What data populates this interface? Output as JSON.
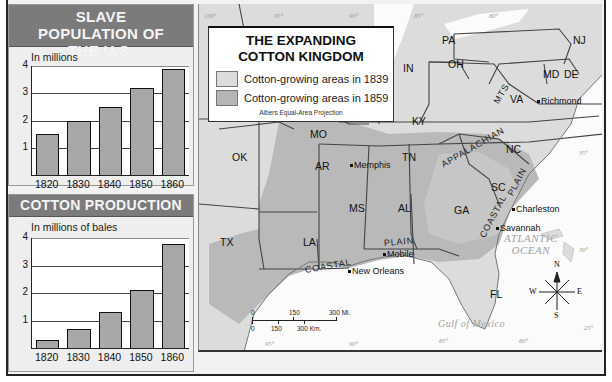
{
  "chart_data": [
    {
      "type": "bar",
      "title": "SLAVE POPULATION OF THE U.S.",
      "ylabel": "In millions",
      "xlabel": "",
      "categories": [
        "1820",
        "1830",
        "1840",
        "1850",
        "1860"
      ],
      "values": [
        1.5,
        2.0,
        2.5,
        3.2,
        3.9
      ],
      "ylim": [
        0,
        4
      ],
      "yticks": [
        "1",
        "2",
        "3",
        "4"
      ],
      "grid": true
    },
    {
      "type": "bar",
      "title": "COTTON PRODUCTION",
      "ylabel": "In millions of bales",
      "xlabel": "",
      "categories": [
        "1820",
        "1830",
        "1840",
        "1850",
        "1860"
      ],
      "values": [
        0.3,
        0.7,
        1.3,
        2.1,
        3.8
      ],
      "ylim": [
        0,
        4
      ],
      "yticks": [
        "1",
        "2",
        "3",
        "4"
      ],
      "grid": true
    }
  ],
  "map": {
    "title_line1": "THE EXPANDING",
    "title_line2": "COTTON KINGDOM",
    "legend": [
      {
        "label": "Cotton-growing areas in 1839",
        "color": "#d9d9d9"
      },
      {
        "label": "Cotton-growing areas in 1859",
        "color": "#b3b3b3"
      }
    ],
    "projection": "Albers Equal-Area Projection",
    "states": [
      {
        "abbr": "PA",
        "x": 442,
        "y": 34
      },
      {
        "abbr": "NJ",
        "x": 573,
        "y": 34
      },
      {
        "abbr": "OH",
        "x": 448,
        "y": 58
      },
      {
        "abbr": "IN",
        "x": 403,
        "y": 62
      },
      {
        "abbr": "MD",
        "x": 543,
        "y": 68
      },
      {
        "abbr": "DE",
        "x": 564,
        "y": 68
      },
      {
        "abbr": "VA",
        "x": 510,
        "y": 93
      },
      {
        "abbr": "KY",
        "x": 412,
        "y": 115
      },
      {
        "abbr": "MO",
        "x": 310,
        "y": 128
      },
      {
        "abbr": "OK",
        "x": 232,
        "y": 151
      },
      {
        "abbr": "TN",
        "x": 402,
        "y": 151
      },
      {
        "abbr": "NC",
        "x": 506,
        "y": 143
      },
      {
        "abbr": "AR",
        "x": 315,
        "y": 160
      },
      {
        "abbr": "SC",
        "x": 491,
        "y": 181
      },
      {
        "abbr": "MS",
        "x": 349,
        "y": 202
      },
      {
        "abbr": "AL",
        "x": 398,
        "y": 202
      },
      {
        "abbr": "GA",
        "x": 454,
        "y": 204
      },
      {
        "abbr": "TX",
        "x": 220,
        "y": 236
      },
      {
        "abbr": "LA",
        "x": 303,
        "y": 236
      },
      {
        "abbr": "FL",
        "x": 490,
        "y": 288
      }
    ],
    "cities": [
      {
        "name": "Richmond",
        "x": 537,
        "y": 96
      },
      {
        "name": "Memphis",
        "x": 350,
        "y": 160
      },
      {
        "name": "Charleston",
        "x": 512,
        "y": 204
      },
      {
        "name": "Savannah",
        "x": 496,
        "y": 223
      },
      {
        "name": "Mobile",
        "x": 383,
        "y": 249
      },
      {
        "name": "New Orleans",
        "x": 348,
        "y": 266
      }
    ],
    "regions": [
      {
        "text": "APPALACHIAN",
        "x": 442,
        "y": 160,
        "rotate": -30
      },
      {
        "text": "MTS.",
        "x": 496,
        "y": 98,
        "rotate": -60
      },
      {
        "text": "COASTAL",
        "x": 482,
        "y": 232,
        "rotate": -62
      },
      {
        "text": "PLAIN",
        "x": 510,
        "y": 190,
        "rotate": -62
      },
      {
        "text": "COASTAL",
        "x": 305,
        "y": 265,
        "rotate": -10
      },
      {
        "text": "PLAIN",
        "x": 384,
        "y": 238,
        "rotate": -5
      }
    ],
    "oceans": [
      {
        "line1": "ATLANTIC",
        "line2": "OCEAN",
        "x": 504,
        "y": 232
      },
      {
        "line1": "Gulf of Mexico",
        "line2": "",
        "x": 438,
        "y": 318
      }
    ],
    "scale_bar": {
      "mi_labels": [
        "0",
        "150",
        "300 Mi."
      ],
      "km_labels": [
        "0",
        "150",
        "300 Km."
      ]
    },
    "compass": {
      "n": "N",
      "s": "S",
      "e": "E",
      "w": "W"
    },
    "longitudes_top": [
      "100°",
      "95°",
      "90°",
      "85°",
      "80°"
    ],
    "longitudes_bottom": [
      "95°",
      "90°",
      "85°",
      "80°"
    ],
    "latitudes": [
      "35°",
      "30°",
      "25°"
    ]
  }
}
